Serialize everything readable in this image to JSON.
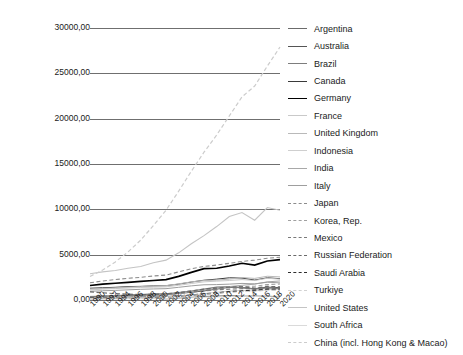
{
  "chart_data": {
    "type": "line",
    "title": "",
    "xlabel": "",
    "ylabel": "",
    "ylim": [
      0,
      30000
    ],
    "xlim": [
      1990,
      2020
    ],
    "grid": true,
    "legend_position": "right",
    "ytick_labels": [
      "30000,00",
      "25000,00",
      "20000,00",
      "15000,00",
      "10000,00",
      "5000,00",
      "0,00"
    ],
    "ytick_values": [
      30000,
      25000,
      20000,
      15000,
      10000,
      5000,
      0
    ],
    "xtick_labels": [
      "1990",
      "1992",
      "1994",
      "1996",
      "1998",
      "2000",
      "2002",
      "2004",
      "2006",
      "2008",
      "2010",
      "2012",
      "2014",
      "2016",
      "2018",
      "2020"
    ],
    "x": [
      1990,
      1992,
      1994,
      1996,
      1998,
      2000,
      2002,
      2004,
      2006,
      2008,
      2010,
      2012,
      2014,
      2016,
      2018,
      2020
    ],
    "series": [
      {
        "name": "Argentina",
        "style": "solid",
        "color": "#6b6b6b",
        "width": 1.0,
        "values": [
          120,
          150,
          190,
          230,
          250,
          230,
          130,
          200,
          290,
          390,
          430,
          480,
          420,
          430,
          420,
          330
        ]
      },
      {
        "name": "Australia",
        "style": "solid",
        "color": "#555555",
        "width": 1.0,
        "values": [
          390,
          420,
          450,
          500,
          520,
          520,
          560,
          720,
          850,
          1000,
          1200,
          1400,
          1350,
          1250,
          1420,
          1360
        ]
      },
      {
        "name": "Brazil",
        "style": "solid",
        "color": "#7d7d7d",
        "width": 1.3,
        "values": [
          330,
          390,
          450,
          560,
          600,
          660,
          680,
          800,
          980,
          1200,
          1420,
          1460,
          1380,
          1200,
          1340,
          1260
        ]
      },
      {
        "name": "Canada",
        "style": "solid",
        "color": "#3a3a3a",
        "width": 1.0,
        "values": [
          1300,
          1350,
          1400,
          1480,
          1500,
          1560,
          1580,
          1750,
          1980,
          2180,
          2300,
          2450,
          2420,
          2200,
          2450,
          2350
        ]
      },
      {
        "name": "Germany",
        "style": "solid",
        "color": "#000000",
        "width": 1.7,
        "values": [
          1600,
          1750,
          1850,
          1950,
          2050,
          2150,
          2250,
          2600,
          3050,
          3450,
          3500,
          3750,
          4050,
          3850,
          4300,
          4450
        ]
      },
      {
        "name": "France",
        "style": "solid",
        "color": "#c9c9c9",
        "width": 1.0,
        "values": [
          1100,
          1200,
          1260,
          1320,
          1380,
          1420,
          1450,
          1620,
          1820,
          2000,
          2080,
          2150,
          2250,
          2150,
          2400,
          2300
        ]
      },
      {
        "name": "United Kingdom",
        "style": "solid",
        "color": "#b9b9b9",
        "width": 1.0,
        "values": [
          1200,
          1280,
          1340,
          1420,
          1480,
          1540,
          1580,
          1780,
          2000,
          2150,
          2200,
          2300,
          2480,
          2380,
          2620,
          2550
        ]
      },
      {
        "name": "Indonesia",
        "style": "solid",
        "color": "#cfcfcf",
        "width": 1.0,
        "values": [
          200,
          240,
          280,
          330,
          300,
          330,
          380,
          450,
          560,
          700,
          860,
          980,
          1050,
          1000,
          1140,
          1180
        ]
      },
      {
        "name": "India",
        "style": "solid",
        "color": "#a8a8a8",
        "width": 1.0,
        "values": [
          250,
          290,
          340,
          400,
          440,
          500,
          570,
          720,
          920,
          1100,
          1300,
          1480,
          1620,
          1750,
          2000,
          2100
        ]
      },
      {
        "name": "Italy",
        "style": "solid",
        "color": "#9e9e9e",
        "width": 1.0,
        "values": [
          950,
          1020,
          1060,
          1120,
          1180,
          1220,
          1250,
          1400,
          1560,
          1680,
          1700,
          1750,
          1830,
          1780,
          1960,
          1890
        ]
      },
      {
        "name": "Japan",
        "style": "dashed",
        "color": "#8c8c8c",
        "width": 1.1,
        "values": [
          1900,
          2100,
          2250,
          2400,
          2500,
          2650,
          2750,
          3100,
          3450,
          3700,
          3850,
          4050,
          4250,
          4400,
          4600,
          4720
        ]
      },
      {
        "name": "Korea, Rep.",
        "style": "dashed",
        "color": "#a0a0a0",
        "width": 1.1,
        "values": [
          300,
          380,
          450,
          520,
          480,
          560,
          640,
          790,
          950,
          1080,
          1250,
          1380,
          1480,
          1520,
          1700,
          1760
        ]
      },
      {
        "name": "Mexico",
        "style": "dashed",
        "color": "#7a7a7a",
        "width": 1.2,
        "values": [
          350,
          400,
          450,
          500,
          540,
          600,
          640,
          750,
          880,
          1000,
          1120,
          1200,
          1250,
          1230,
          1380,
          1300
        ]
      },
      {
        "name": "Russian Federation",
        "style": "dashed",
        "color": "#6a6a6a",
        "width": 1.2,
        "values": [
          900,
          800,
          700,
          650,
          600,
          620,
          680,
          820,
          1000,
          1200,
          1300,
          1420,
          1460,
          1300,
          1500,
          1450
        ]
      },
      {
        "name": "Saudi Arabia",
        "style": "dashed",
        "color": "#2e2e2e",
        "width": 1.5,
        "values": [
          180,
          200,
          230,
          260,
          280,
          310,
          350,
          430,
          540,
          650,
          780,
          900,
          1000,
          1050,
          1180,
          1150
        ]
      },
      {
        "name": "Turkiye",
        "style": "dashed",
        "color": "#d2d2d2",
        "width": 1.0,
        "values": [
          160,
          190,
          220,
          250,
          280,
          320,
          350,
          430,
          530,
          630,
          740,
          840,
          920,
          960,
          1080,
          1100
        ]
      },
      {
        "name": "United States",
        "style": "solid",
        "color": "#c4c4c4",
        "width": 1.1,
        "values": [
          2900,
          3100,
          3250,
          3500,
          3700,
          4100,
          4400,
          5200,
          6200,
          7100,
          8100,
          9200,
          9650,
          8800,
          10200,
          9900
        ]
      },
      {
        "name": "South Africa",
        "style": "solid",
        "color": "#dadada",
        "width": 1.0,
        "values": [
          80,
          95,
          110,
          130,
          140,
          150,
          165,
          200,
          250,
          300,
          340,
          380,
          400,
          390,
          430,
          420
        ]
      },
      {
        "name": "China (incl. Hong Kong & Macao)",
        "style": "dashed",
        "color": "#cccccc",
        "width": 1.2,
        "values": [
          2600,
          3300,
          4200,
          5300,
          6600,
          8200,
          9900,
          12000,
          14200,
          16300,
          18200,
          20300,
          22400,
          23600,
          25800,
          27900
        ]
      }
    ]
  },
  "legend": {
    "items": [
      {
        "label": "Argentina"
      },
      {
        "label": "Australia"
      },
      {
        "label": "Brazil"
      },
      {
        "label": "Canada"
      },
      {
        "label": "Germany"
      },
      {
        "label": "France"
      },
      {
        "label": "United Kingdom"
      },
      {
        "label": "Indonesia"
      },
      {
        "label": "India"
      },
      {
        "label": "Italy"
      },
      {
        "label": "Japan"
      },
      {
        "label": "Korea, Rep."
      },
      {
        "label": "Mexico"
      },
      {
        "label": "Russian Federation"
      },
      {
        "label": "Saudi Arabia"
      },
      {
        "label": "Turkiye"
      },
      {
        "label": "United States"
      },
      {
        "label": "South Africa"
      },
      {
        "label": "China (incl. Hong Kong & Macao)"
      }
    ]
  }
}
